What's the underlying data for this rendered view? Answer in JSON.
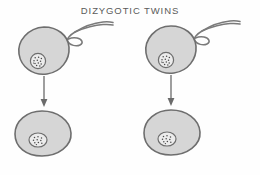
{
  "figure": {
    "title": "DIZYGOTIC TWINS",
    "title_color": "#5a5a5a",
    "background_color": "#fefefe",
    "cell_fill_color": "#d6d6d6",
    "cell_outline_color": "#6e6e6e",
    "nucleus_fill_color": "#ececec",
    "chromatin_color": "#4a4a4a",
    "arrow_color": "#6b6b6b",
    "sperm_color": "#7a7a7a"
  },
  "units": [
    {
      "id": "left",
      "egg_label": "ovum-left",
      "sperm_label": "sperm-left",
      "arrow_label": "fertilization-arrow-left",
      "zygote_label": "zygote-left"
    },
    {
      "id": "right",
      "egg_label": "ovum-right",
      "sperm_label": "sperm-right",
      "arrow_label": "fertilization-arrow-right",
      "zygote_label": "zygote-right"
    }
  ]
}
